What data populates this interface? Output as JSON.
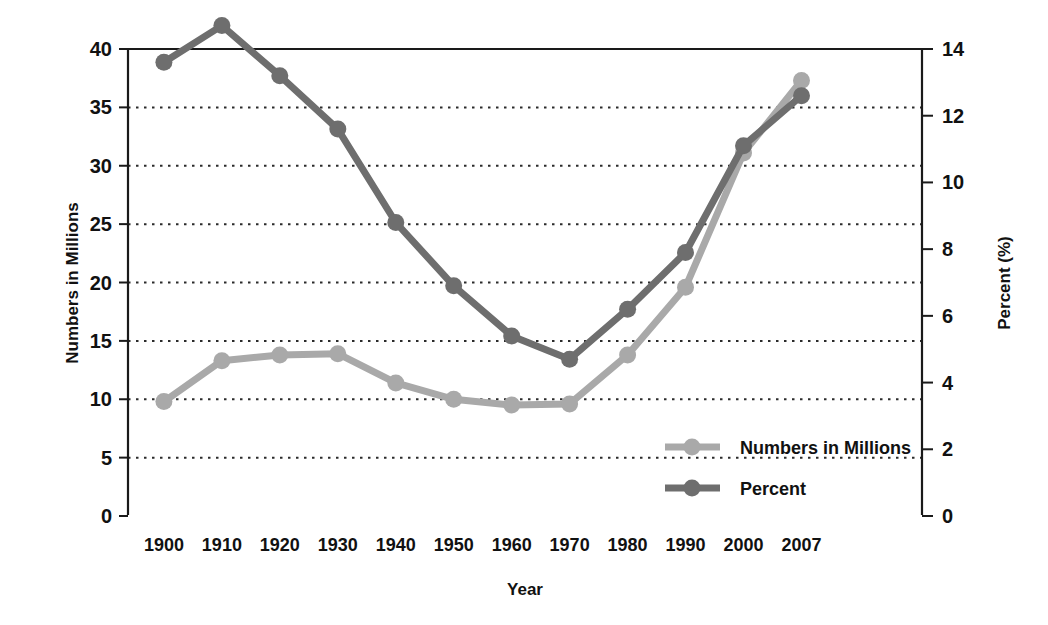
{
  "chart_data": {
    "type": "line",
    "title": "",
    "subtitle": "",
    "xlabel": "Year",
    "ylabel": "Numbers in Millions",
    "y2label": "Percent (%)",
    "categories": [
      "1900",
      "1910",
      "1920",
      "1930",
      "1940",
      "1950",
      "1960",
      "1970",
      "1980",
      "1990",
      "2000",
      "2007"
    ],
    "xticklabels": [
      "1900",
      "1910",
      "1920",
      "1930",
      "1940",
      "1950",
      "1960",
      "1970",
      "1980",
      "1990",
      "2000",
      "2007"
    ],
    "yticklabels": [
      "0",
      "5",
      "10",
      "15",
      "20",
      "25",
      "30",
      "35",
      "40"
    ],
    "yticks": [
      0,
      5,
      10,
      15,
      20,
      25,
      30,
      35,
      40
    ],
    "ylim": [
      0,
      40
    ],
    "y2ticklabels": [
      "0",
      "2",
      "4",
      "6",
      "8",
      "10",
      "12",
      "14"
    ],
    "y2ticks": [
      0,
      2,
      4,
      6,
      8,
      10,
      12,
      14
    ],
    "y2lim": [
      0,
      14
    ],
    "grid": "horizontal-dotted",
    "legend_position": "inside-lower-right",
    "series": [
      {
        "name": "Numbers in Millions",
        "axis": "left",
        "color": "#a9a9a9",
        "values": [
          9.8,
          13.3,
          13.8,
          13.9,
          11.4,
          10.0,
          9.5,
          9.6,
          13.8,
          19.6,
          31.1,
          37.3
        ]
      },
      {
        "name": "Percent",
        "axis": "right",
        "color": "#6e6e6e",
        "values": [
          13.6,
          14.7,
          13.2,
          11.6,
          8.8,
          6.9,
          5.4,
          4.7,
          6.2,
          7.9,
          11.1,
          12.6
        ]
      }
    ],
    "legend": [
      {
        "label": "Numbers in Millions",
        "color": "#a9a9a9"
      },
      {
        "label": "Percent",
        "color": "#6e6e6e"
      }
    ],
    "colors": {
      "background": "#ffffff",
      "axis": "#1a1a1a",
      "grid": "#2b2b2b",
      "series_numbers": "#a9a9a9",
      "series_percent": "#6e6e6e",
      "text": "#111111"
    }
  }
}
